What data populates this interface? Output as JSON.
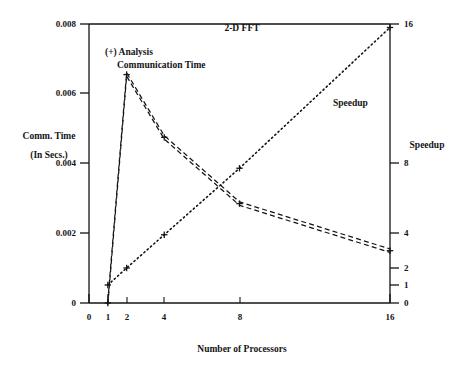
{
  "chart_data": {
    "type": "line",
    "title": "2-D FFT",
    "xlabel": "Number of Processors",
    "ylabel": "Comm. Time",
    "ylabel2": "(In Secs.)",
    "y2label": "Speedup",
    "x": [
      1,
      2,
      4,
      8,
      16
    ],
    "xticks": [
      0,
      1,
      2,
      4,
      8,
      16
    ],
    "xtick_labels": [
      "0",
      "1",
      "2",
      "4",
      "8",
      "16"
    ],
    "xlim": [
      0,
      16
    ],
    "yticks": [
      0,
      0.002,
      0.004,
      0.006,
      0.008
    ],
    "ytick_labels": [
      "0",
      "0.002",
      "0.004",
      "0.006",
      "0.008"
    ],
    "ylim": [
      0,
      0.008
    ],
    "y2ticks": [
      0,
      1,
      2,
      4,
      8,
      16
    ],
    "y2tick_labels": [
      "0",
      "1",
      "2",
      "4",
      "8",
      "16"
    ],
    "y2lim": [
      0,
      16
    ],
    "grid": false,
    "legend_position": "inline-annotation",
    "series": [
      {
        "name": "Communication Time",
        "axis": "left",
        "style": "dashed-double",
        "marker": "+",
        "values": [
          0.0,
          0.00655,
          0.00475,
          0.00285,
          0.0015
        ]
      },
      {
        "name": "Speedup",
        "axis": "right",
        "style": "dotted",
        "marker": "+",
        "values": [
          1.0,
          2.0,
          3.9,
          7.7,
          15.8
        ]
      }
    ],
    "annotations": [
      {
        "name": "analysis-annotation-line1",
        "text": "(+) Analysis"
      },
      {
        "name": "analysis-annotation-line2",
        "text": "Communication Time"
      },
      {
        "name": "speedup-series-label",
        "text": "Speedup"
      }
    ]
  }
}
